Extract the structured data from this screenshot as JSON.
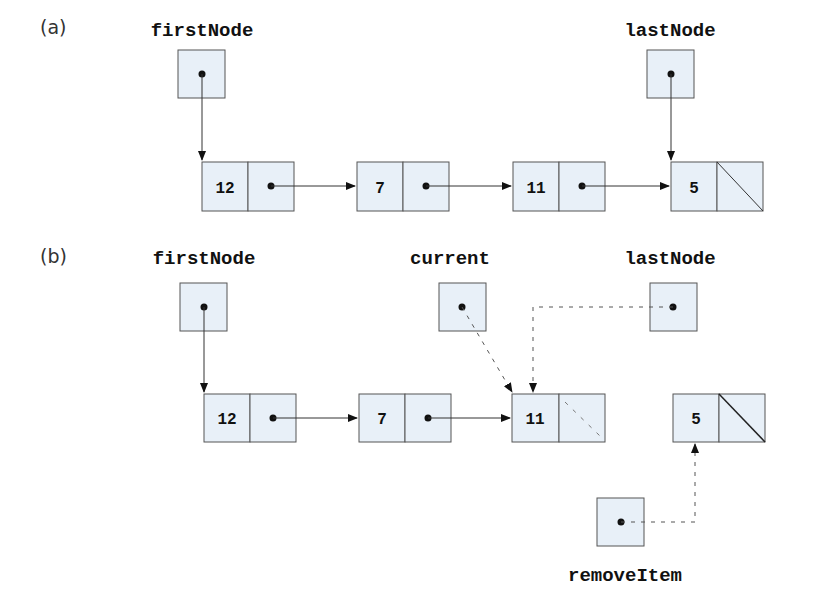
{
  "parts": {
    "a": {
      "label": "(a)",
      "first_node_label": "firstNode",
      "last_node_label": "lastNode",
      "nodes": [
        "12",
        "7",
        "11",
        "5"
      ]
    },
    "b": {
      "label": "(b)",
      "first_node_label": "firstNode",
      "current_label": "current",
      "last_node_label": "lastNode",
      "remove_item_label": "removeItem",
      "nodes": [
        "12",
        "7",
        "11",
        "5"
      ]
    }
  },
  "colors": {
    "node_fill": "#e8f0f8",
    "stroke": "#555555"
  }
}
